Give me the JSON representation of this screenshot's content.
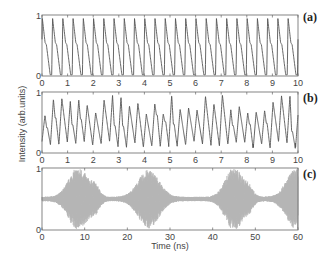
{
  "chart_data": [
    {
      "type": "line",
      "panel_label": "(a)",
      "xlabel": "",
      "ylabel": "Intensity (arb.units)",
      "xlim": [
        0,
        10
      ],
      "ylim": [
        0,
        1
      ],
      "x_ticks": [
        0,
        1,
        2,
        3,
        4,
        5,
        6,
        7,
        8,
        9,
        10
      ],
      "y_ticks": [
        0,
        1
      ],
      "description": "Periodic sawtooth-like pulses, ~2.5 cycles per ns; peak ~0.95, shoulder ~0.5, trough ~0.02",
      "period_ns": 0.4,
      "line_color": "#555555"
    },
    {
      "type": "line",
      "panel_label": "(b)",
      "xlabel": "",
      "ylabel": "Intensity (arb.units)",
      "xlim": [
        0,
        10
      ],
      "ylim": [
        0,
        1
      ],
      "x_ticks": [
        0,
        1,
        2,
        3,
        4,
        5,
        6,
        7,
        8,
        9,
        10
      ],
      "y_ticks": [
        0,
        1
      ],
      "description": "Quasi-periodic / chaotic oscillation with irregular peak heights between ~0.6 and ~1.0, ~3 cycles per ns",
      "period_ns": 0.33,
      "line_color": "#555555"
    },
    {
      "type": "line",
      "panel_label": "(c)",
      "xlabel": "Time (ns)",
      "ylabel": "Intensity (arb.units)",
      "xlim": [
        0,
        60
      ],
      "ylim": [
        0,
        1
      ],
      "x_ticks": [
        0,
        10,
        20,
        30,
        40,
        50,
        60
      ],
      "y_ticks": [
        0,
        1
      ],
      "description": "Fast oscillation around 0.5 with intermittent bursts (envelope maxima near 8, 12, 25, 45, 59 ns)",
      "baseline": 0.5,
      "bursts": [
        {
          "center": 8.5,
          "width": 2.2,
          "amp": 0.48
        },
        {
          "center": 12.5,
          "width": 1.0,
          "amp": 0.14
        },
        {
          "center": 25.0,
          "width": 2.4,
          "amp": 0.44
        },
        {
          "center": 45.0,
          "width": 2.0,
          "amp": 0.48
        },
        {
          "center": 48.5,
          "width": 1.0,
          "amp": 0.12
        },
        {
          "center": 59.5,
          "width": 2.2,
          "amp": 0.45
        }
      ],
      "line_color": "#b5b5b5"
    }
  ],
  "figure": {
    "ylabel": "Intensity (arb.units)",
    "xlabel": "Time (ns)",
    "panel_labels": [
      "(a)",
      "(b)",
      "(c)"
    ]
  }
}
